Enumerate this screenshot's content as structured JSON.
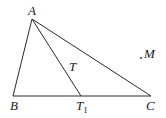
{
  "diagram": {
    "type": "triangle-geometry",
    "line_color": "#2a2a2a",
    "points": {
      "A": {
        "x": 32,
        "y": 19
      },
      "B": {
        "x": 13,
        "y": 96
      },
      "C": {
        "x": 151,
        "y": 96
      },
      "T1": {
        "x": 81,
        "y": 96
      },
      "M": {
        "x": 141,
        "y": 58
      }
    },
    "segments": [
      [
        "A",
        "B"
      ],
      [
        "B",
        "C"
      ],
      [
        "A",
        "C"
      ],
      [
        "A",
        "T1"
      ]
    ],
    "labels": {
      "A": "A",
      "B": "B",
      "C": "C",
      "T": "T",
      "T1_main": "T",
      "T1_sub": "1",
      "M": "M"
    }
  }
}
